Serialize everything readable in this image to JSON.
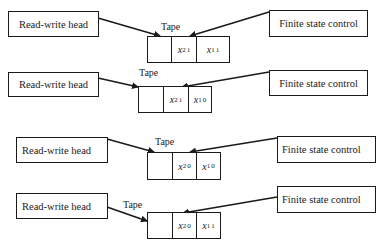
{
  "diagram": {
    "panels": [
      {
        "head_label": "Read-write head",
        "control_label": "Finite state control",
        "tape_label": "Tape",
        "cells": [
          {
            "var": "",
            "sub": "",
            "sup": ""
          },
          {
            "var": "x",
            "sub": "2",
            "sup": "1"
          },
          {
            "var": "x",
            "sub": "1",
            "sup": "1"
          }
        ]
      },
      {
        "head_label": "Read-write head",
        "control_label": "Finite state control",
        "tape_label": "Tape",
        "cells": [
          {
            "var": "",
            "sub": "",
            "sup": ""
          },
          {
            "var": "x",
            "sub": "2",
            "sup": "1"
          },
          {
            "var": "x",
            "sub": "1",
            "sup": "0"
          }
        ]
      },
      {
        "head_label": "Read-write head",
        "control_label": "Finite state control",
        "tape_label": "Tape",
        "cells": [
          {
            "var": "",
            "sub": "",
            "sup": ""
          },
          {
            "var": "x",
            "sub": "2",
            "sup": "0"
          },
          {
            "var": "x",
            "sub": "1",
            "sup": "0"
          }
        ]
      },
      {
        "head_label": "Read-write head",
        "control_label": "Finite state control",
        "tape_label": "Tape",
        "cells": [
          {
            "var": "",
            "sub": "",
            "sup": ""
          },
          {
            "var": "x",
            "sub": "2",
            "sup": "0"
          },
          {
            "var": "x",
            "sub": "1",
            "sup": "1"
          }
        ]
      }
    ]
  }
}
